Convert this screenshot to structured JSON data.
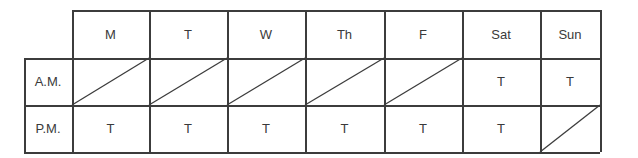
{
  "table": {
    "columns": [
      "M",
      "T",
      "W",
      "Th",
      "F",
      "Sat",
      "Sun"
    ],
    "rows": [
      {
        "label": "A.M.",
        "cells": [
          "",
          "",
          "",
          "",
          "",
          "T",
          "T"
        ],
        "crossed": [
          true,
          true,
          true,
          true,
          true,
          false,
          false
        ]
      },
      {
        "label": "P.M.",
        "cells": [
          "T",
          "T",
          "T",
          "T",
          "T",
          "T",
          ""
        ],
        "crossed": [
          false,
          false,
          false,
          false,
          false,
          false,
          true
        ]
      }
    ]
  }
}
